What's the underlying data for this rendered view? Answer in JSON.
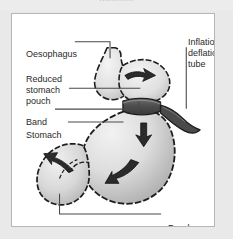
{
  "figure": {
    "kind": "medical-anatomy-diagram",
    "top_bleed_text": "............",
    "background_color": "#e9e9e9",
    "panel_color": "#ffffff",
    "border_color": "#b6b6b6",
    "line_color": "#4a4a4a",
    "outline_color": "#1c1c1c",
    "organ_fill_light": "#efefef",
    "organ_fill_mid": "#d2d2d2",
    "organ_fill_dark": "#9d9d9d",
    "band_color": "#5a5a5a",
    "arrow_color": "#2b2b2b",
    "text_color": "#2a2a2a"
  },
  "labels": {
    "oesophagus": "Oesophagus",
    "reduced_stomach_pouch": "Reduced stomach pouch",
    "band": "Band",
    "stomach": "Stomach",
    "inflation_deflation_tube": "Inflation-deflation tube",
    "duodenum": "Duodenum"
  },
  "parts": [
    {
      "name": "oesophagus",
      "label": "Oesophagus",
      "label_side": "left"
    },
    {
      "name": "reduced-stomach-pouch",
      "label": "Reduced stomach pouch",
      "label_side": "left"
    },
    {
      "name": "band",
      "label": "Band",
      "label_side": "left"
    },
    {
      "name": "stomach",
      "label": "Stomach",
      "label_side": "left"
    },
    {
      "name": "inflation-deflation-tube",
      "label": "Inflation-deflation tube",
      "label_side": "right"
    },
    {
      "name": "duodenum",
      "label": "Duodenum",
      "label_side": "bottom-right"
    }
  ],
  "arrows": [
    {
      "name": "arrow-pouch-inflow",
      "direction": "down-right",
      "location": "reduced stomach pouch"
    },
    {
      "name": "arrow-stomach-upper",
      "direction": "down",
      "location": "upper stomach body"
    },
    {
      "name": "arrow-stomach-lower",
      "direction": "down-left",
      "location": "lower stomach body"
    },
    {
      "name": "arrow-duodenum-outflow",
      "direction": "up-left",
      "location": "duodenum"
    }
  ]
}
